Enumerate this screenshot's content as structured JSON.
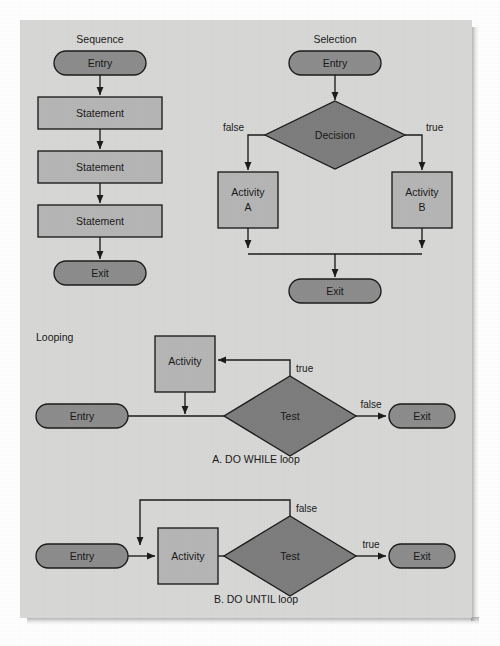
{
  "figure": {
    "panel_background": "#d8d8d6",
    "page_background": "#ffffff",
    "shape_colors": {
      "terminator": "#8d8d8d",
      "process": "#b6b6b6",
      "decision": "#7e7e7e",
      "outline": "#1c1c1c",
      "text": "#1a1a1a"
    }
  },
  "sections": {
    "sequence": {
      "title": "Sequence",
      "nodes": [
        {
          "id": "seq-entry",
          "label": "Entry",
          "shape": "terminator"
        },
        {
          "id": "seq-stmt-1",
          "label": "Statement",
          "shape": "process"
        },
        {
          "id": "seq-stmt-2",
          "label": "Statement",
          "shape": "process"
        },
        {
          "id": "seq-stmt-3",
          "label": "Statement",
          "shape": "process"
        },
        {
          "id": "seq-exit",
          "label": "Exit",
          "shape": "terminator"
        }
      ]
    },
    "selection": {
      "title": "Selection",
      "nodes": [
        {
          "id": "sel-entry",
          "label": "Entry",
          "shape": "terminator"
        },
        {
          "id": "sel-decision",
          "label": "Decision",
          "shape": "decision"
        },
        {
          "id": "sel-activity-a",
          "label": "Activity",
          "label2": "A",
          "shape": "process"
        },
        {
          "id": "sel-activity-b",
          "label": "Activity",
          "label2": "B",
          "shape": "process"
        },
        {
          "id": "sel-exit",
          "label": "Exit",
          "shape": "terminator"
        }
      ],
      "edge_labels": {
        "false": "false",
        "true": "true"
      }
    },
    "looping": {
      "title": "Looping",
      "do_while": {
        "caption": "A.  DO WHILE loop",
        "nodes": [
          {
            "id": "dw-entry",
            "label": "Entry",
            "shape": "terminator"
          },
          {
            "id": "dw-activity",
            "label": "Activity",
            "shape": "process"
          },
          {
            "id": "dw-test",
            "label": "Test",
            "shape": "decision"
          },
          {
            "id": "dw-exit",
            "label": "Exit",
            "shape": "terminator"
          }
        ],
        "edge_labels": {
          "true": "true",
          "false": "false"
        }
      },
      "do_until": {
        "caption": "B.  DO UNTIL loop",
        "nodes": [
          {
            "id": "du-entry",
            "label": "Entry",
            "shape": "terminator"
          },
          {
            "id": "du-activity",
            "label": "Activity",
            "shape": "process"
          },
          {
            "id": "du-test",
            "label": "Test",
            "shape": "decision"
          },
          {
            "id": "du-exit",
            "label": "Exit",
            "shape": "terminator"
          }
        ],
        "edge_labels": {
          "false": "false",
          "true": "true"
        }
      }
    }
  }
}
